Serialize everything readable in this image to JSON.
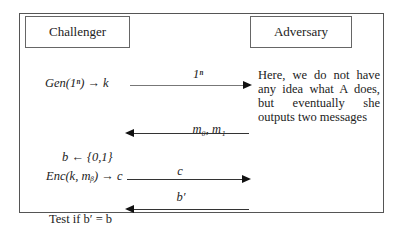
{
  "parties": {
    "challenger": "Challenger",
    "adversary": "Adversary"
  },
  "challenger_steps": {
    "gen": "Gen(1ⁿ) → k",
    "sample_b": "b ← {0,1}",
    "enc": "Enc(k, mᵦ) → c",
    "test": "Test if b′ = b"
  },
  "adversary_note": "Here, we do not have any idea what A does, but eventually she outputs two messages",
  "messages": [
    {
      "label": "1ⁿ",
      "direction": "right"
    },
    {
      "label": "m₀, m₁",
      "direction": "left"
    },
    {
      "label": "c",
      "direction": "right"
    },
    {
      "label": "b′",
      "direction": "left"
    }
  ]
}
